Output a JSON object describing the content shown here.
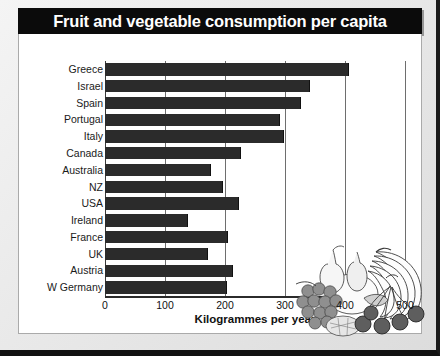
{
  "title": "Fruit and vegetable consumption per capita",
  "source_note": "Source: FAO Crop Production Statistics 1990",
  "illustration": {
    "name": "fruit-basket-illustration",
    "items": [
      "pear",
      "pear",
      "grapes",
      "bananas",
      "cherries",
      "melon",
      "pineapple"
    ]
  },
  "colors": {
    "title_bar": "#0b0b0b",
    "title_text": "#ffffff",
    "bar": "#2b2b2b",
    "gridline": "#6e6e6e",
    "panel": "#ffffff",
    "page_background": "#e8e8e8"
  },
  "chart_data": {
    "type": "bar",
    "orientation": "horizontal",
    "title": "Fruit and vegetable consumption per capita",
    "xlabel": "Kilogrammes per year",
    "ylabel": "",
    "xlim": [
      0,
      500
    ],
    "xticks": [
      0,
      100,
      200,
      300,
      400,
      500
    ],
    "xtick_labels": [
      "0",
      "100",
      "200",
      "300",
      "400",
      "500"
    ],
    "grid": true,
    "legend": false,
    "units": "kg per year",
    "categories": [
      "Greece",
      "Israel",
      "Spain",
      "Portugal",
      "Italy",
      "Canada",
      "Australia",
      "NZ",
      "USA",
      "Ireland",
      "France",
      "UK",
      "Austria",
      "W Germany"
    ],
    "values": [
      407,
      342,
      327,
      292,
      299,
      227,
      177,
      197,
      224,
      139,
      205,
      172,
      214,
      204
    ],
    "annotation": "Source: FAO Crop Production Statistics 1990"
  }
}
